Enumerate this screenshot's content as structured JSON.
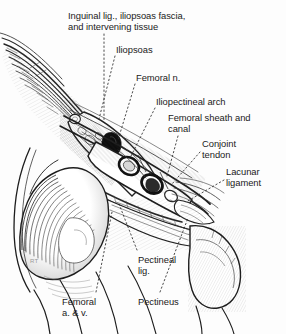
{
  "figure": {
    "kind": "anatomical-illustration",
    "style": "pen-and-ink line drawing, black and white",
    "background_color": "#fdfdfd",
    "ink_color": "#1b1b1b",
    "artist_mark": "RT"
  },
  "labels": [
    {
      "id": "inguinal-ligament",
      "text": "Inguinal lig., iliopsoas fascia,\nand intervening tissue",
      "x": 68,
      "y": 10,
      "align": "left"
    },
    {
      "id": "iliopsoas",
      "text": "Iliopsoas",
      "x": 116,
      "y": 44,
      "align": "left"
    },
    {
      "id": "femoral-nerve",
      "text": "Femoral n.",
      "x": 136,
      "y": 72,
      "align": "left"
    },
    {
      "id": "iliopectineal-arch",
      "text": "Iliopectineal arch",
      "x": 156,
      "y": 96,
      "align": "left"
    },
    {
      "id": "femoral-sheath",
      "text": "Femoral sheath and\ncanal",
      "x": 168,
      "y": 112,
      "align": "left"
    },
    {
      "id": "conjoint-tendon",
      "text": "Conjoint\ntendon",
      "x": 202,
      "y": 138,
      "align": "left"
    },
    {
      "id": "lacunar-ligament",
      "text": "Lacunar\nligament",
      "x": 226,
      "y": 166,
      "align": "left"
    },
    {
      "id": "pectineal-ligament",
      "text": "Pectineal\nlig.",
      "x": 138,
      "y": 254,
      "align": "left"
    },
    {
      "id": "pectineus",
      "text": "Pectineus",
      "x": 138,
      "y": 296,
      "align": "left"
    },
    {
      "id": "femoral-vessels",
      "text": "Femoral\na. & v.",
      "x": 62,
      "y": 296,
      "align": "left"
    }
  ],
  "leader_lines": [
    {
      "id": "leader-inguinal-ligament",
      "points": "104,34 104,120"
    },
    {
      "id": "leader-iliopsoas",
      "points": "115,56 99,119"
    },
    {
      "id": "leader-femoral-nerve",
      "points": "135,84 118,140"
    },
    {
      "id": "leader-iliopectineal-arch",
      "points": "155,108 131,156"
    },
    {
      "id": "leader-femoral-sheath",
      "points": "178,136 167,176"
    },
    {
      "id": "leader-conjoint-tendon",
      "points": "200,150 172,184"
    },
    {
      "id": "leader-lacunar-ligament",
      "points": "224,178 186,200"
    },
    {
      "id": "leader-pectineal-ligament",
      "points": "137,250 119,204"
    },
    {
      "id": "leader-pectineus",
      "points": "160,292 188,218"
    },
    {
      "id": "leader-femoral-vessels",
      "points": "96,292 112,212"
    }
  ],
  "structures": [
    {
      "id": "femoral-artery-section",
      "shape": "oval",
      "note": "thick dark ring, upper of the two vessel cross-sections"
    },
    {
      "id": "femoral-vein-section",
      "shape": "oval",
      "note": "thick dark ring, lower of the two vessel cross-sections"
    },
    {
      "id": "femoral-nerve-section",
      "shape": "solid black ellipse",
      "note": "dense black area within iliopsoas"
    },
    {
      "id": "acetabulum-femoral-head",
      "note": "large hatched dome, lower left"
    },
    {
      "id": "superior-pubic-ramus",
      "note": "bone profile, right side"
    }
  ]
}
